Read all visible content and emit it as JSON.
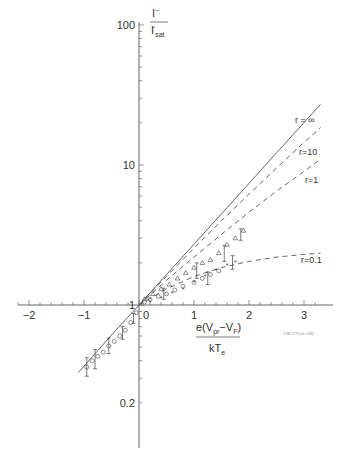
{
  "chart_data": {
    "type": "scatter",
    "title": "",
    "xlabel": "e(V_pr - V_F) / kT_e",
    "ylabel": "I^- / I^-_sat",
    "yscale": "log",
    "xlim": [
      -2.4,
      3.4
    ],
    "ylim": [
      0.1,
      100
    ],
    "grid": false,
    "x_ticks": [
      -2,
      -1,
      0,
      1,
      2,
      3
    ],
    "x_tick_labels": [
      "−2",
      "−1",
      "0",
      "1",
      "2",
      "3"
    ],
    "y_ticks": [
      100,
      10,
      1,
      0.2
    ],
    "y_tick_labels": [
      "100",
      "10",
      "1",
      "0.2"
    ],
    "ylabel_parts": {
      "num": "I",
      "num_sup": "−",
      "den": "I",
      "den_sup": "−",
      "den_sub": "sat"
    },
    "xlabel_parts": {
      "num_pre": "e(V",
      "num_sub1": "pr",
      "num_mid": "−V",
      "num_sub2": "F",
      "num_post": ")",
      "den": "kT",
      "den_sub": "e"
    },
    "reference_code": "CTRD 2778 (rev. 1086)",
    "curves": [
      {
        "name": "r = ∞",
        "label": "r = ∞",
        "style": "solid",
        "x": [
          -1.1,
          -0.5,
          0,
          0.5,
          1,
          1.5,
          2,
          2.5,
          3,
          3.3
        ],
        "y": [
          0.33,
          0.61,
          1.0,
          1.65,
          2.72,
          4.48,
          7.39,
          12.2,
          20.1,
          27.1
        ]
      },
      {
        "name": "r = 10",
        "label": "r=10",
        "style": "dashed",
        "x": [
          0,
          0.5,
          1,
          1.5,
          2,
          2.5,
          3,
          3.3
        ],
        "y": [
          1.0,
          1.6,
          2.55,
          4.0,
          6.2,
          9.5,
          14.5,
          18.5
        ]
      },
      {
        "name": "r = 1",
        "label": "r=1",
        "style": "dashed",
        "x": [
          0,
          0.5,
          1,
          1.5,
          2,
          2.5,
          3,
          3.3
        ],
        "y": [
          1.0,
          1.5,
          2.2,
          3.2,
          4.6,
          6.5,
          9.0,
          11.0
        ]
      },
      {
        "name": "r = 0.1",
        "label": "r=0.1",
        "style": "dashed",
        "x": [
          0,
          0.5,
          1,
          1.5,
          2,
          2.5,
          3,
          3.3
        ],
        "y": [
          1.0,
          1.3,
          1.6,
          1.85,
          2.05,
          2.2,
          2.3,
          2.35
        ]
      }
    ],
    "series": [
      {
        "name": "circles",
        "marker": "circle",
        "x": [
          -0.95,
          -0.85,
          -0.75,
          -0.65,
          -0.55,
          -0.45,
          -0.35,
          -0.25,
          -0.15,
          -0.05,
          0.1,
          0.2,
          0.35,
          0.5,
          0.65,
          0.8,
          1.0,
          1.15,
          1.3,
          1.45
        ],
        "y": [
          0.36,
          0.4,
          0.43,
          0.46,
          0.51,
          0.55,
          0.6,
          0.66,
          0.75,
          0.88,
          1.05,
          1.1,
          1.15,
          1.2,
          1.28,
          1.36,
          1.45,
          1.55,
          1.65,
          1.75
        ]
      },
      {
        "name": "triangles",
        "marker": "triangle",
        "x": [
          0.1,
          0.25,
          0.4,
          0.55,
          0.7,
          0.85,
          1.0,
          1.15,
          1.3,
          1.45,
          1.6,
          1.75,
          1.9
        ],
        "y": [
          1.1,
          1.2,
          1.3,
          1.4,
          1.55,
          1.7,
          1.85,
          2.0,
          2.1,
          2.35,
          2.7,
          3.0,
          3.4
        ]
      },
      {
        "name": "stars",
        "marker": "star",
        "x": [
          0.2,
          0.4,
          0.6,
          0.8,
          1.0,
          1.2,
          1.4,
          1.6,
          1.75
        ],
        "y": [
          1.05,
          1.12,
          1.2,
          1.3,
          1.45,
          1.6,
          1.75,
          1.9,
          2.0
        ]
      }
    ],
    "error_bars": [
      {
        "x": -0.95,
        "y": 0.36,
        "lo": 0.31,
        "hi": 0.42
      },
      {
        "x": -0.8,
        "y": 0.41,
        "lo": 0.35,
        "hi": 0.48
      },
      {
        "x": -0.55,
        "y": 0.51,
        "lo": 0.45,
        "hi": 0.58
      },
      {
        "x": -0.3,
        "y": 0.63,
        "lo": 0.57,
        "hi": 0.7
      },
      {
        "x": -0.1,
        "y": 0.8,
        "lo": 0.74,
        "hi": 0.87
      },
      {
        "x": 0.45,
        "y": 1.2,
        "lo": 1.1,
        "hi": 1.32
      },
      {
        "x": 1.05,
        "y": 1.75,
        "lo": 1.55,
        "hi": 2.0
      },
      {
        "x": 1.25,
        "y": 1.55,
        "lo": 1.4,
        "hi": 1.72
      },
      {
        "x": 1.55,
        "y": 2.35,
        "lo": 2.05,
        "hi": 2.65
      },
      {
        "x": 1.7,
        "y": 2.0,
        "lo": 1.8,
        "hi": 2.25
      },
      {
        "x": 1.85,
        "y": 3.2,
        "lo": 2.9,
        "hi": 3.5
      }
    ]
  }
}
